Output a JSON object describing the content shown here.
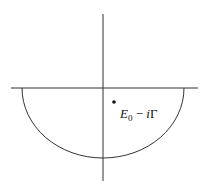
{
  "diagram": {
    "type": "contour-integration",
    "stroke_color": "#333333",
    "real_axis": {
      "x1": 11,
      "y": 88,
      "x2": 198
    },
    "imag_axis": {
      "x": 103,
      "y1": 14,
      "y2": 181
    },
    "contour": {
      "kind": "lower-semicircle",
      "center": [
        103,
        88
      ],
      "rx": 81,
      "ry": 70
    },
    "pole": {
      "x": 114,
      "y": 102,
      "label_symbol": "E",
      "label_subscript": "0",
      "label_operator": " − ",
      "label_imag": "i",
      "label_gamma": "Γ"
    }
  }
}
